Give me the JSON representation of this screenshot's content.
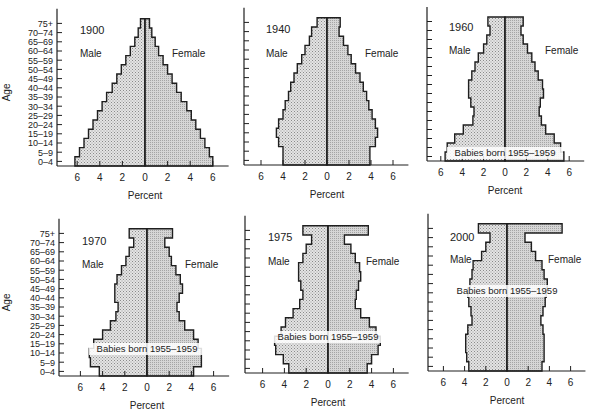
{
  "figure": {
    "y_axis_label": "Age",
    "x_axis_label": "Percent",
    "male_label": "Male",
    "female_label": "Female",
    "annotation": "Babies born 1955–1959"
  },
  "chart_data": [
    {
      "type": "bar",
      "subtype": "population-pyramid",
      "title": "1900",
      "categories": [
        "0-4",
        "5-9",
        "10-14",
        "15-19",
        "20-24",
        "25-29",
        "30-34",
        "35-39",
        "40-44",
        "45-49",
        "50-54",
        "55-59",
        "60-64",
        "65-69",
        "70-74",
        "75+"
      ],
      "series": [
        {
          "name": "Male",
          "values": [
            6.2,
            5.8,
            5.4,
            5.0,
            4.6,
            4.2,
            3.8,
            3.4,
            2.9,
            2.5,
            2.1,
            1.7,
            1.3,
            0.9,
            0.6,
            0.4
          ]
        },
        {
          "name": "Female",
          "values": [
            6.0,
            5.7,
            5.3,
            4.9,
            4.5,
            4.1,
            3.7,
            3.2,
            2.8,
            2.4,
            2.0,
            1.6,
            1.2,
            0.9,
            0.6,
            0.4
          ]
        }
      ],
      "xlabel": "Percent",
      "ylabel": "Age",
      "xticks": [
        6,
        4,
        2,
        0,
        2,
        4,
        6
      ],
      "xlim": [
        -6,
        6
      ],
      "annotation": null
    },
    {
      "type": "bar",
      "subtype": "population-pyramid",
      "title": "1940",
      "categories": [
        "0-4",
        "5-9",
        "10-14",
        "15-19",
        "20-24",
        "25-29",
        "30-34",
        "35-39",
        "40-44",
        "45-49",
        "50-54",
        "55-59",
        "60-64",
        "65-69",
        "70-74",
        "75+"
      ],
      "series": [
        {
          "name": "Male",
          "values": [
            4.0,
            4.0,
            4.4,
            4.6,
            4.4,
            4.0,
            3.8,
            3.5,
            3.3,
            3.0,
            2.7,
            2.3,
            2.0,
            1.6,
            1.4,
            0.9
          ]
        },
        {
          "name": "Female",
          "values": [
            3.9,
            3.9,
            4.4,
            4.6,
            4.4,
            4.1,
            3.8,
            3.6,
            3.3,
            3.0,
            2.6,
            2.2,
            1.9,
            1.5,
            1.1,
            1.2
          ]
        }
      ],
      "xlabel": "Percent",
      "ylabel": "Age",
      "xticks": [
        6,
        4,
        2,
        0,
        2,
        4,
        6
      ],
      "xlim": [
        -6,
        6
      ],
      "annotation": null
    },
    {
      "type": "bar",
      "subtype": "population-pyramid",
      "title": "1960",
      "categories": [
        "0-4",
        "5-9",
        "10-14",
        "15-19",
        "20-24",
        "25-29",
        "30-34",
        "35-39",
        "40-44",
        "45-49",
        "50-54",
        "55-59",
        "60-64",
        "65-69",
        "70-74",
        "75+"
      ],
      "series": [
        {
          "name": "Male",
          "values": [
            5.6,
            5.4,
            4.7,
            3.9,
            3.0,
            2.9,
            3.2,
            3.4,
            3.4,
            3.1,
            2.8,
            2.5,
            2.0,
            1.7,
            1.4,
            1.6
          ]
        },
        {
          "name": "Female",
          "values": [
            5.5,
            5.2,
            4.6,
            3.8,
            3.4,
            3.2,
            3.3,
            3.6,
            3.5,
            3.1,
            2.8,
            2.5,
            2.1,
            1.7,
            1.5,
            1.7
          ]
        }
      ],
      "xlabel": "Percent",
      "ylabel": "Age",
      "xticks": [
        6,
        4,
        2,
        0,
        2,
        4,
        6
      ],
      "xlim": [
        -6,
        6
      ],
      "annotation": {
        "text": "Babies born 1955–1959",
        "age_group": "0-4"
      }
    },
    {
      "type": "bar",
      "subtype": "population-pyramid",
      "title": "1970",
      "categories": [
        "0-4",
        "5-9",
        "10-14",
        "15-19",
        "20-24",
        "25-29",
        "30-34",
        "35-39",
        "40-44",
        "45-49",
        "50-54",
        "55-59",
        "60-64",
        "65-69",
        "70-74",
        "75+"
      ],
      "series": [
        {
          "name": "Male",
          "values": [
            4.3,
            5.1,
            5.2,
            4.8,
            4.0,
            3.3,
            2.8,
            2.6,
            2.9,
            2.9,
            2.7,
            2.3,
            1.9,
            1.6,
            1.2,
            1.6
          ]
        },
        {
          "name": "Female",
          "values": [
            4.2,
            4.9,
            4.9,
            4.6,
            4.2,
            3.4,
            2.9,
            2.7,
            2.9,
            3.2,
            3.0,
            2.6,
            2.2,
            2.0,
            1.6,
            2.3
          ]
        }
      ],
      "xlabel": "Percent",
      "ylabel": "Age",
      "xticks": [
        6,
        4,
        2,
        0,
        2,
        4,
        6
      ],
      "xlim": [
        -6,
        6
      ],
      "annotation": {
        "text": "Babies born 1955–1959",
        "age_group": "10-14"
      }
    },
    {
      "type": "bar",
      "subtype": "population-pyramid",
      "title": "1975",
      "categories": [
        "0-4",
        "5-9",
        "10-14",
        "15-19",
        "20-24",
        "25-29",
        "30-34",
        "35-39",
        "40-44",
        "45-49",
        "50-54",
        "55-59",
        "60-64",
        "65-69",
        "70-74",
        "75+"
      ],
      "series": [
        {
          "name": "Male",
          "values": [
            3.6,
            4.1,
            4.8,
            4.9,
            4.3,
            3.9,
            3.2,
            2.6,
            2.3,
            2.5,
            2.7,
            2.7,
            2.3,
            2.0,
            1.5,
            2.3
          ]
        },
        {
          "name": "Female",
          "values": [
            3.6,
            4.0,
            4.6,
            4.8,
            4.4,
            3.8,
            3.0,
            2.5,
            2.6,
            2.8,
            3.0,
            2.9,
            2.5,
            2.1,
            1.5,
            3.7
          ]
        }
      ],
      "xlabel": "Percent",
      "ylabel": "Age",
      "xticks": [
        6,
        4,
        2,
        0,
        2,
        4,
        6
      ],
      "xlim": [
        -6,
        6
      ],
      "annotation": {
        "text": "Babies born 1955–1959",
        "age_group": "15-19"
      }
    },
    {
      "type": "bar",
      "subtype": "population-pyramid",
      "title": "2000",
      "categories": [
        "0-4",
        "5-9",
        "10-14",
        "15-19",
        "20-24",
        "25-29",
        "30-34",
        "35-39",
        "40-44",
        "45-49",
        "50-54",
        "55-59",
        "60-64",
        "65-69",
        "70-74",
        "75+"
      ],
      "series": [
        {
          "name": "Male",
          "values": [
            3.6,
            3.8,
            3.9,
            3.9,
            3.7,
            3.3,
            3.4,
            3.6,
            3.7,
            3.5,
            3.3,
            3.2,
            2.4,
            2.0,
            1.6,
            2.7
          ]
        },
        {
          "name": "Female",
          "values": [
            3.3,
            3.5,
            3.5,
            3.5,
            3.4,
            3.2,
            3.4,
            3.6,
            3.7,
            3.8,
            3.5,
            3.3,
            2.7,
            2.3,
            1.7,
            5.2
          ]
        }
      ],
      "xlabel": "Percent",
      "ylabel": "Age",
      "xticks": [
        6,
        4,
        2,
        0,
        2,
        4,
        6
      ],
      "xlim": [
        -6,
        6
      ],
      "annotation": {
        "text": "Babies born 1955–1959",
        "age_group": "40-44"
      }
    }
  ],
  "layout": {
    "panels": [
      {
        "axis_x": 57,
        "zero_x": 145,
        "scale": 11.3,
        "base_y": 166,
        "row_h": 9.2,
        "show_age_labels": true,
        "title_xy": [
          80,
          34
        ],
        "male_xy": [
          80,
          57
        ],
        "female_xy": [
          172,
          57
        ],
        "ann_y": null
      },
      {
        "axis_x": 244,
        "zero_x": 327,
        "scale": 11.0,
        "base_y": 165,
        "row_h": 9.2,
        "show_age_labels": false,
        "title_xy": [
          266,
          33
        ],
        "male_xy": [
          266,
          57
        ],
        "female_xy": [
          365,
          57
        ],
        "ann_y": null
      },
      {
        "axis_x": 427,
        "zero_x": 505,
        "scale": 10.7,
        "base_y": 161,
        "row_h": 9.0,
        "show_age_labels": false,
        "title_xy": [
          449,
          31
        ],
        "male_xy": [
          449,
          54
        ],
        "female_xy": [
          545,
          54
        ],
        "ann_y": 156
      },
      {
        "axis_x": 59,
        "zero_x": 147,
        "scale": 11.1,
        "base_y": 376,
        "row_h": 9.2,
        "show_age_labels": true,
        "title_xy": [
          82,
          245
        ],
        "male_xy": [
          82,
          268
        ],
        "female_xy": [
          185,
          268
        ],
        "ann_y": 352
      },
      {
        "axis_x": 245,
        "zero_x": 328,
        "scale": 10.9,
        "base_y": 373,
        "row_h": 9.2,
        "show_age_labels": false,
        "title_xy": [
          268,
          241
        ],
        "male_xy": [
          268,
          265
        ],
        "female_xy": [
          366,
          265
        ],
        "ann_y": 340
      },
      {
        "axis_x": 428,
        "zero_x": 507,
        "scale": 10.6,
        "base_y": 371,
        "row_h": 9.2,
        "show_age_labels": false,
        "title_xy": [
          450,
          241
        ],
        "male_xy": [
          450,
          263
        ],
        "female_xy": [
          548,
          263
        ],
        "ann_y": 294
      }
    ],
    "colors": {
      "ink": "#1f1f1f",
      "male_fill": "#d9d9d9",
      "female_fill": "#cfcfcf",
      "bg": "#ffffff"
    }
  }
}
